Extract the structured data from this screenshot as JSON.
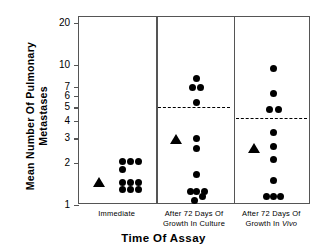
{
  "chart_data": {
    "type": "scatter",
    "title": "",
    "xlabel": "Time Of Assay",
    "ylabel": "Mean Number Of Pulmonary\nMetastases",
    "yscale": "log",
    "ylim": [
      1,
      22
    ],
    "yticks": [
      1,
      2,
      3,
      4,
      5,
      6,
      7,
      10,
      20
    ],
    "ytick_labels": [
      "1",
      "2",
      "3",
      "4",
      "5",
      "6",
      "7",
      "10",
      "20"
    ],
    "grid": false,
    "legend": "none",
    "groups": [
      {
        "name": "Immediate",
        "label": "Immediate",
        "mean_marker": 1.45,
        "mean_line": null,
        "values": [
          2.05,
          2.05,
          2.05,
          1.8,
          1.45,
          1.45,
          1.45,
          1.3,
          1.3,
          1.3
        ]
      },
      {
        "name": "After 72 Days Of Growth In Culture",
        "label": "After 72 Days Of\nGrowth In Culture",
        "mean_marker": 2.95,
        "mean_line": 5.0,
        "values": [
          8.0,
          6.9,
          6.9,
          5.4,
          3.0,
          2.55,
          1.65,
          1.25,
          1.25,
          1.15,
          1.08,
          1.25
        ]
      },
      {
        "name": "After 72 Days Of Growth In Vivo",
        "label": "After 72 Days Of\nGrowth In ",
        "label_italic": "Vivo",
        "mean_marker": 2.55,
        "mean_line": 4.2,
        "values": [
          9.4,
          6.3,
          4.8,
          4.8,
          3.3,
          2.6,
          2.1,
          1.5,
          1.15,
          1.15,
          1.15
        ]
      }
    ]
  },
  "colors": {
    "marker": "#000000",
    "axis": "#555555",
    "background": "#ffffff"
  }
}
